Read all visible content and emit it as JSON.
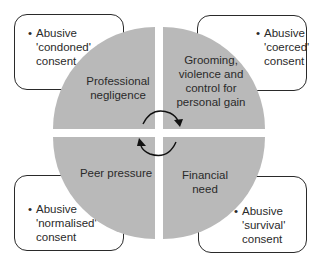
{
  "diagram": {
    "type": "quadrant-circle",
    "colors": {
      "quadrant_fill": "#b9b9b9",
      "box_border": "#2a2a2a",
      "text": "#2a2a2a",
      "background": "#ffffff"
    },
    "quadrants": [
      {
        "position": "top-left",
        "label_lines": [
          "Professional",
          "negligence"
        ]
      },
      {
        "position": "top-right",
        "label_lines": [
          "Grooming,",
          "violence and",
          "control for",
          "personal gain"
        ]
      },
      {
        "position": "bottom-left",
        "label_lines": [
          "Peer pressure"
        ]
      },
      {
        "position": "bottom-right",
        "label_lines": [
          "Financial",
          "need"
        ]
      }
    ],
    "boxes": [
      {
        "position": "top-left",
        "bullet": "•",
        "lines": [
          "Abusive",
          "'condoned'",
          "consent"
        ]
      },
      {
        "position": "top-right",
        "bullet": "•",
        "lines": [
          "Abusive",
          "'coerced'",
          "consent"
        ]
      },
      {
        "position": "bottom-left",
        "bullet": "•",
        "lines": [
          "Abusive",
          "'normalised'",
          "consent"
        ]
      },
      {
        "position": "bottom-right",
        "bullet": "•",
        "lines": [
          "Abusive",
          "'survival'",
          "consent"
        ]
      }
    ],
    "arrows": [
      {
        "name": "clockwise-arrow-top",
        "from": "top-left",
        "to": "top-right"
      },
      {
        "name": "clockwise-arrow-bottom",
        "from": "bottom-right",
        "to": "bottom-left"
      }
    ]
  }
}
